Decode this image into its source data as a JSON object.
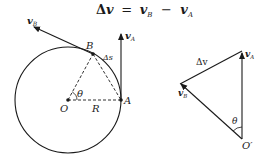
{
  "equation": {
    "delta": "Δ",
    "lhs": "v",
    "eq": "=",
    "term1": "v",
    "term1_sub": "B",
    "minus": "−",
    "term2": "v",
    "term2_sub": "A"
  },
  "left_figure": {
    "labels": {
      "vB": "v",
      "vB_sub": "B",
      "vA": "v",
      "vA_sub": "A",
      "B": "B",
      "A": "A",
      "O": "O",
      "R": "R",
      "theta": "θ",
      "delta_s": "Δs"
    }
  },
  "right_figure": {
    "labels": {
      "delta_v": "Δv",
      "vA": "v",
      "vA_sub": "A",
      "vB": "v",
      "vB_sub": "B",
      "theta": "θ",
      "O_prime": "O′"
    }
  },
  "colors": {
    "stroke": "#1a1a1a",
    "background": "#ffffff"
  }
}
